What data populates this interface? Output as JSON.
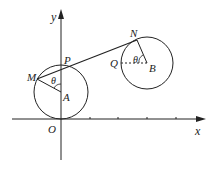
{
  "diagram": {
    "type": "geometry",
    "stroke_color": "#222222",
    "background": "#ffffff",
    "axes": {
      "x_label": "x",
      "y_label": "y",
      "origin_label": "O"
    },
    "points": {
      "O": "O",
      "A": "A",
      "B": "B",
      "M": "M",
      "P": "P",
      "N": "N",
      "Q": "Q"
    },
    "angles": {
      "at_A": "θ",
      "at_B": "θ"
    },
    "circles": [
      {
        "center": "A",
        "tangent_to": "x-axis at O"
      },
      {
        "center": "B"
      }
    ],
    "segments": [
      "MA",
      "MN",
      "NB",
      "QB (dashed)"
    ]
  }
}
